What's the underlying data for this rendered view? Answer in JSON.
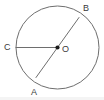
{
  "figure": {
    "type": "circle-geometry-diagram",
    "background_color": "#ffffff",
    "stroke_color": "#6e6e6e",
    "label_color": "#3a3a3a",
    "center_dot_color": "#1a1a1a",
    "circle": {
      "center_x": 57.5,
      "center_y": 47.5,
      "radius": 41.5
    },
    "center_point": {
      "label": "O",
      "x": 57.5,
      "y": 47.5,
      "dot_radius": 2.1,
      "label_x": 62,
      "label_y": 50
    },
    "points": [
      {
        "id": "B",
        "label": "B",
        "x": 79,
        "y": 17.5,
        "label_x": 83,
        "label_y": 9,
        "position": "upper-right on circle"
      },
      {
        "id": "C",
        "label": "C",
        "x": 16,
        "y": 47.5,
        "label_x": 4,
        "label_y": 48,
        "position": "left on circle"
      },
      {
        "id": "A",
        "label": "A",
        "x": 36,
        "y": 77.5,
        "label_x": 31,
        "label_y": 93,
        "position": "lower-left on circle"
      }
    ],
    "segments": [
      {
        "id": "AB",
        "name": "diameter-ab",
        "from": "A",
        "to": "B",
        "kind": "diameter",
        "x1": 36,
        "y1": 77.5,
        "x2": 79,
        "y2": 17.5
      },
      {
        "id": "OC",
        "name": "radius-oc",
        "from": "O",
        "to": "C",
        "kind": "radius",
        "x1": 57.5,
        "y1": 47.5,
        "x2": 16,
        "y2": 47.5
      }
    ]
  }
}
